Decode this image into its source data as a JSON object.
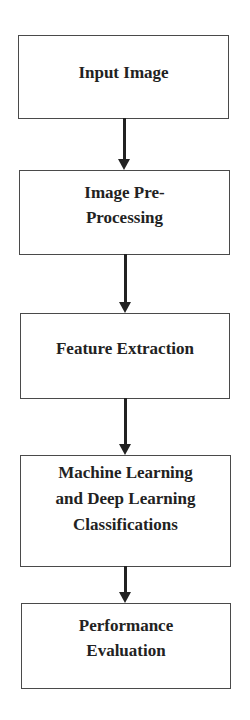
{
  "diagram": {
    "type": "flowchart",
    "direction": "top-to-bottom",
    "colors": {
      "border": "#4a4a4a",
      "text": "#222222",
      "arrow": "#222222",
      "background": "#ffffff"
    },
    "nodes": [
      {
        "id": "input-image",
        "label": "Input Image"
      },
      {
        "id": "image-pre-processing",
        "label": "Image Pre-\nProcessing"
      },
      {
        "id": "feature-extraction",
        "label": "Feature Extraction"
      },
      {
        "id": "ml-dl-classifications",
        "label": "Machine Learning\nand Deep Learning\nClassifications"
      },
      {
        "id": "performance-evaluation",
        "label": "Performance\nEvaluation"
      }
    ],
    "edges": [
      {
        "from": "input-image",
        "to": "image-pre-processing"
      },
      {
        "from": "image-pre-processing",
        "to": "feature-extraction"
      },
      {
        "from": "feature-extraction",
        "to": "ml-dl-classifications"
      },
      {
        "from": "ml-dl-classifications",
        "to": "performance-evaluation"
      }
    ]
  }
}
